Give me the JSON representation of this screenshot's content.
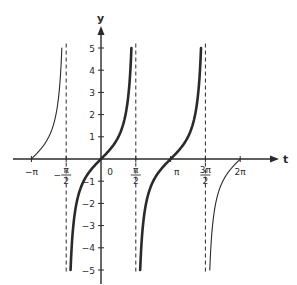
{
  "chart_data": {
    "type": "line",
    "title": "",
    "xlabel": "t",
    "ylabel": "y",
    "function": "y = tan t",
    "xlim": [
      -3.14159,
      6.28318
    ],
    "ylim": [
      -5,
      5
    ],
    "grid": false,
    "legend": null,
    "x_ticks": [
      {
        "value": -3.14159,
        "label": "−π"
      },
      {
        "value": -1.5708,
        "label": "−π/2"
      },
      {
        "value": 0,
        "label": "0"
      },
      {
        "value": 1.5708,
        "label": "π/2"
      },
      {
        "value": 3.14159,
        "label": "π"
      },
      {
        "value": 4.71239,
        "label": "3π/2"
      },
      {
        "value": 6.28318,
        "label": "2π"
      }
    ],
    "y_ticks": [
      -5,
      -4,
      -3,
      -2,
      -1,
      1,
      2,
      3,
      4,
      5
    ],
    "asymptotes": [
      -1.5708,
      1.5708,
      4.71239
    ],
    "series": [
      {
        "name": "tan t on (−π, −π/2)",
        "style": "thin",
        "t_range": [
          -3.14159,
          -1.7682
        ]
      },
      {
        "name": "tan t on (−π/2, π/2)",
        "style": "thick",
        "t_range": [
          -1.3734,
          1.3734
        ]
      },
      {
        "name": "tan t on (π/2, 3π/2)",
        "style": "thick",
        "t_range": [
          1.7682,
          4.515
        ]
      },
      {
        "name": "tan t on (3π/2, 2π)",
        "style": "thin",
        "t_range": [
          4.9098,
          6.28318
        ]
      }
    ]
  },
  "colors": {
    "ink": "#2a2a2a",
    "background": "#ffffff"
  }
}
